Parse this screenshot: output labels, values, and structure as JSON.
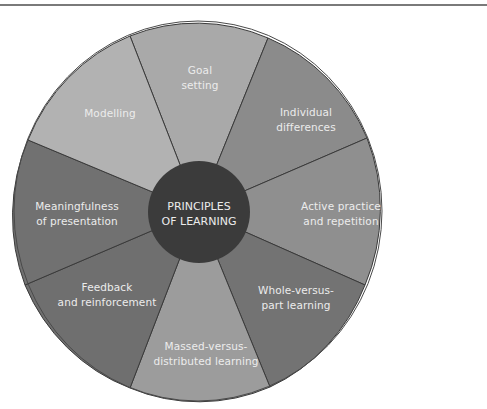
{
  "diagram": {
    "center": {
      "line1": "PRINCIPLES",
      "line2": "OF LEARNING",
      "color": "#3b3b3b"
    },
    "segments": [
      {
        "line1": "Goal",
        "line2": "setting",
        "color": "#a9a9a9"
      },
      {
        "line1": "Individual",
        "line2": "differences",
        "color": "#8b8b8b"
      },
      {
        "line1": "Active practice",
        "line2": "and repetition",
        "color": "#8f8f8f"
      },
      {
        "line1": "Whole-versus-",
        "line2": "part learning",
        "color": "#737373"
      },
      {
        "line1": "Massed-versus-",
        "line2": "distributed learning",
        "color": "#9c9c9c"
      },
      {
        "line1": "Feedback",
        "line2": "and reinforcement",
        "color": "#6f6f6f"
      },
      {
        "line1": "Meaningfulness",
        "line2": "of presentation",
        "color": "#717171"
      },
      {
        "line1": "Modelling",
        "line2": "",
        "color": "#b2b2b2"
      }
    ],
    "divider_color": "#3a3a3a"
  }
}
